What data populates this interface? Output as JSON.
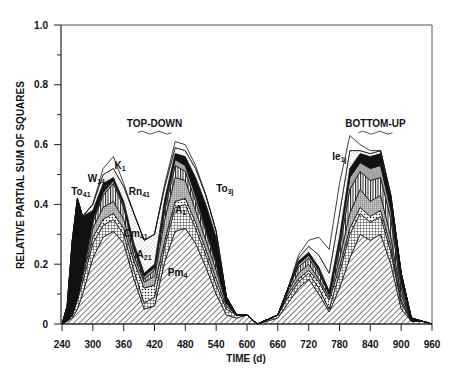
{
  "chart_data": {
    "type": "area",
    "stacked": true,
    "title": "",
    "xlabel": "TIME (d)",
    "ylabel": "RELATIVE PARTIAL SUM OF SQUARES",
    "xlim": [
      240,
      960
    ],
    "ylim": [
      0,
      1.0
    ],
    "xticks": [
      240,
      300,
      360,
      420,
      480,
      540,
      600,
      660,
      720,
      780,
      840,
      900,
      960
    ],
    "yticks": [
      0,
      0.2,
      0.4,
      0.6,
      0.8,
      1.0
    ],
    "ytick_labels": [
      "0",
      "0.2",
      "0.4",
      "0.6",
      "0.8",
      "1.0"
    ],
    "grid": false,
    "legend": "none (inline annotations)",
    "group_labels": [
      {
        "text": "TOP-DOWN",
        "x": 420,
        "y": 0.66
      },
      {
        "text": "BOTTOM-UP",
        "x": 850,
        "y": 0.66
      }
    ],
    "x": [
      240,
      250,
      260,
      270,
      280,
      300,
      320,
      340,
      360,
      380,
      400,
      420,
      440,
      460,
      480,
      500,
      520,
      540,
      560,
      580,
      600,
      620,
      660,
      680,
      700,
      720,
      740,
      760,
      780,
      800,
      820,
      840,
      860,
      880,
      900,
      920,
      940,
      960
    ],
    "series": [
      {
        "name": "Pm4",
        "pattern": "diagonal-hatch",
        "color": "#9a9a9a",
        "values": [
          0.0,
          0.01,
          0.02,
          0.05,
          0.1,
          0.22,
          0.29,
          0.31,
          0.27,
          0.15,
          0.05,
          0.06,
          0.21,
          0.31,
          0.32,
          0.27,
          0.19,
          0.1,
          0.03,
          0.02,
          0.03,
          0.0,
          0.02,
          0.07,
          0.12,
          0.15,
          0.1,
          0.04,
          0.12,
          0.22,
          0.3,
          0.28,
          0.3,
          0.2,
          0.05,
          0.01,
          0.01,
          0.0
        ]
      },
      {
        "name": "Cm41",
        "pattern": "cross-hatch",
        "color": "#bdbdbd",
        "values": [
          0.0,
          0.0,
          0.01,
          0.03,
          0.04,
          0.05,
          0.04,
          0.04,
          0.03,
          0.03,
          0.02,
          0.03,
          0.05,
          0.08,
          0.08,
          0.05,
          0.04,
          0.03,
          0.02,
          0.01,
          0.0,
          0.0,
          0.01,
          0.02,
          0.02,
          0.02,
          0.02,
          0.01,
          0.05,
          0.08,
          0.07,
          0.06,
          0.06,
          0.04,
          0.02,
          0.0,
          0.0,
          0.0
        ]
      },
      {
        "name": "A21",
        "pattern": "dots",
        "color": "#d9d9d9",
        "values": [
          0.0,
          0.0,
          0.0,
          0.01,
          0.02,
          0.02,
          0.02,
          0.02,
          0.02,
          0.03,
          0.05,
          0.04,
          0.02,
          0.02,
          0.02,
          0.02,
          0.02,
          0.02,
          0.01,
          0.0,
          0.0,
          0.0,
          0.0,
          0.01,
          0.01,
          0.01,
          0.02,
          0.03,
          0.02,
          0.02,
          0.02,
          0.02,
          0.02,
          0.02,
          0.01,
          0.0,
          0.0,
          0.0
        ]
      },
      {
        "name": "A1",
        "pattern": "fine-grid",
        "color": "#8c8c8c",
        "values": [
          0.0,
          0.0,
          0.0,
          0.0,
          0.01,
          0.03,
          0.04,
          0.04,
          0.03,
          0.02,
          0.02,
          0.03,
          0.07,
          0.08,
          0.06,
          0.04,
          0.03,
          0.03,
          0.01,
          0.0,
          0.0,
          0.0,
          0.0,
          0.01,
          0.02,
          0.02,
          0.01,
          0.01,
          0.03,
          0.05,
          0.06,
          0.05,
          0.05,
          0.03,
          0.02,
          0.0,
          0.0,
          0.0
        ]
      },
      {
        "name": "W14",
        "pattern": "vertical-lines",
        "color": "#6e6e6e",
        "values": [
          0.0,
          0.0,
          0.0,
          0.0,
          0.01,
          0.02,
          0.04,
          0.06,
          0.04,
          0.02,
          0.01,
          0.02,
          0.03,
          0.04,
          0.03,
          0.03,
          0.03,
          0.02,
          0.0,
          0.0,
          0.0,
          0.0,
          0.0,
          0.01,
          0.02,
          0.02,
          0.02,
          0.01,
          0.03,
          0.08,
          0.06,
          0.07,
          0.06,
          0.06,
          0.02,
          0.0,
          0.0,
          0.0
        ]
      },
      {
        "name": "Ie1j",
        "pattern": "stipple-gray",
        "color": "#b0b0b0",
        "values": [
          0.0,
          0.0,
          0.0,
          0.0,
          0.0,
          0.01,
          0.01,
          0.01,
          0.01,
          0.01,
          0.01,
          0.01,
          0.02,
          0.02,
          0.02,
          0.02,
          0.01,
          0.01,
          0.0,
          0.0,
          0.0,
          0.0,
          0.0,
          0.0,
          0.01,
          0.01,
          0.01,
          0.0,
          0.02,
          0.04,
          0.03,
          0.04,
          0.04,
          0.03,
          0.02,
          0.0,
          0.0,
          0.0
        ]
      },
      {
        "name": "To3j",
        "pattern": "solid-black",
        "color": "#111111",
        "values": [
          0.0,
          0.0,
          0.0,
          0.0,
          0.0,
          0.01,
          0.01,
          0.01,
          0.01,
          0.01,
          0.01,
          0.01,
          0.02,
          0.02,
          0.03,
          0.06,
          0.08,
          0.08,
          0.02,
          0.0,
          0.0,
          0.0,
          0.0,
          0.0,
          0.01,
          0.01,
          0.01,
          0.01,
          0.02,
          0.03,
          0.03,
          0.04,
          0.04,
          0.04,
          0.03,
          0.01,
          0.0,
          0.0
        ]
      },
      {
        "name": "To41",
        "pattern": "solid-black",
        "color": "#000000",
        "values": [
          0.0,
          0.05,
          0.25,
          0.33,
          0.18,
          0.02,
          0.02,
          0.0,
          0.0,
          0.0,
          0.0,
          0.0,
          0.0,
          0.0,
          0.0,
          0.0,
          0.0,
          0.0,
          0.0,
          0.0,
          0.0,
          0.0,
          0.0,
          0.0,
          0.0,
          0.0,
          0.0,
          0.0,
          0.0,
          0.0,
          0.0,
          0.0,
          0.0,
          0.0,
          0.0,
          0.0,
          0.0,
          0.0
        ]
      },
      {
        "name": "Rn41",
        "pattern": "light-stipple",
        "color": "#e6e6e6",
        "values": [
          0.0,
          0.0,
          0.0,
          0.0,
          0.0,
          0.02,
          0.03,
          0.03,
          0.05,
          0.1,
          0.11,
          0.1,
          0.04,
          0.02,
          0.02,
          0.03,
          0.03,
          0.02,
          0.0,
          0.0,
          0.0,
          0.0,
          0.0,
          0.0,
          0.01,
          0.02,
          0.04,
          0.06,
          0.08,
          0.06,
          0.01,
          0.01,
          0.01,
          0.01,
          0.0,
          0.0,
          0.0,
          0.0
        ]
      },
      {
        "name": "K1",
        "pattern": "white-outline",
        "color": "#ffffff",
        "values": [
          0.0,
          0.0,
          0.0,
          0.0,
          0.0,
          0.0,
          0.02,
          0.04,
          0.01,
          0.0,
          0.0,
          0.0,
          0.01,
          0.02,
          0.02,
          0.01,
          0.0,
          0.0,
          0.0,
          0.0,
          0.0,
          0.0,
          0.0,
          0.0,
          0.01,
          0.02,
          0.06,
          0.08,
          0.1,
          0.05,
          0.02,
          0.01,
          0.0,
          0.0,
          0.0,
          0.0,
          0.0,
          0.0
        ]
      }
    ],
    "annotations": [
      {
        "text": "To",
        "sub": "41",
        "x": 258,
        "y": 0.43
      },
      {
        "text": "W",
        "sub": "14",
        "x": 290,
        "y": 0.475
      },
      {
        "text": "K",
        "sub": "1",
        "x": 342,
        "y": 0.52
      },
      {
        "text": "Rn",
        "sub": "41",
        "x": 370,
        "y": 0.43
      },
      {
        "text": "Cm",
        "sub": "41",
        "x": 360,
        "y": 0.29
      },
      {
        "text": "A",
        "sub": "1",
        "x": 460,
        "y": 0.37
      },
      {
        "text": "A",
        "sub": "21",
        "x": 385,
        "y": 0.22
      },
      {
        "text": "Pm",
        "sub": "4",
        "x": 446,
        "y": 0.16
      },
      {
        "text": "To",
        "sub": "3j",
        "x": 540,
        "y": 0.44
      },
      {
        "text": "Ie",
        "sub": "1j",
        "x": 766,
        "y": 0.55
      }
    ]
  }
}
